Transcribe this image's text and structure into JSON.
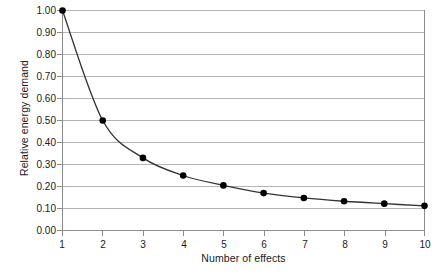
{
  "chart_data": {
    "type": "line",
    "title": "",
    "xlabel": "Number of effects",
    "ylabel": "Relative energy demand",
    "x": [
      1,
      2,
      3,
      4,
      5,
      6,
      7,
      8,
      9,
      10
    ],
    "values": [
      1.0,
      0.5,
      0.33,
      0.25,
      0.205,
      0.17,
      0.148,
      0.133,
      0.122,
      0.112
    ],
    "series": [
      {
        "name": "Relative energy demand",
        "values": [
          1.0,
          0.5,
          0.33,
          0.25,
          0.205,
          0.17,
          0.148,
          0.133,
          0.122,
          0.112
        ]
      }
    ],
    "xlim": [
      1,
      10
    ],
    "ylim": [
      0.0,
      1.0
    ],
    "xticks": [
      "1",
      "2",
      "3",
      "4",
      "5",
      "6",
      "7",
      "8",
      "9",
      "10"
    ],
    "yticks": [
      "0.00",
      "0.10",
      "0.20",
      "0.30",
      "0.40",
      "0.50",
      "0.60",
      "0.70",
      "0.80",
      "0.90",
      "1.00"
    ],
    "grid": "horizontal",
    "legend": "none",
    "marker": "filled-circle",
    "line_color": "#333333",
    "marker_color": "#000000",
    "grid_color": "#b5b5b5",
    "axis_color": "#8c8c8c",
    "background": "#ffffff"
  },
  "caption": {
    "ghost_text": ""
  }
}
